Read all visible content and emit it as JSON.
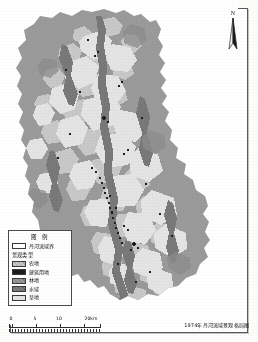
{
  "map": {
    "caption": "1974年丹河流域景观格局图",
    "north_label": "N"
  },
  "legend": {
    "title": "图 例",
    "boundary": {
      "label": "丹河流域界",
      "color": "#ffffff"
    },
    "subhead": "景观类型",
    "classes": [
      {
        "label": "农地",
        "color": "#c9c9c9"
      },
      {
        "label": "建筑用地",
        "color": "#1d1d1d"
      },
      {
        "label": "林地",
        "color": "#9a9a9a"
      },
      {
        "label": "水域",
        "color": "#7e7e7e"
      },
      {
        "label": "草地",
        "color": "#e4e4e4"
      }
    ]
  },
  "scalebar": {
    "ticks": [
      "0",
      "5",
      "10"
    ],
    "unit_label": "20km"
  }
}
